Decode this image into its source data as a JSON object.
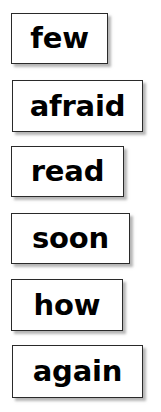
{
  "page": {
    "background_color": "#ffffff",
    "kind": "sight-word flashcard sheet"
  },
  "style": {
    "card_background": "#ffffff",
    "card_border_color": "#2a2a2a",
    "card_shadow_color": "#787878",
    "text_color": "#000000"
  },
  "cards": [
    {
      "word": "few"
    },
    {
      "word": "afraid"
    },
    {
      "word": "read"
    },
    {
      "word": "soon"
    },
    {
      "word": "how"
    },
    {
      "word": "again"
    }
  ]
}
